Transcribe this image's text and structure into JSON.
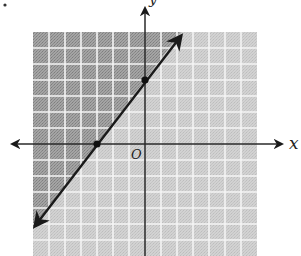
{
  "figure": {
    "type": "linear-inequality-graph",
    "axes": {
      "x_label": "x",
      "y_label": "y",
      "origin_label": "O"
    },
    "grid": {
      "x_min": -7,
      "x_max": 7,
      "y_min": -7,
      "y_max": 7,
      "unit_px": 16
    },
    "boundary_line": {
      "equation": "y = 4/3 x + 4",
      "style": "solid",
      "arrows": "both",
      "marked_points": [
        {
          "x": -3,
          "y": 0
        },
        {
          "x": 0,
          "y": 4
        }
      ]
    },
    "shading": {
      "region": "above-left of line",
      "shaded_color": "#9a9a9a",
      "unshaded_color": "#cfcfcf",
      "grid_line_color": "#f2f2f2"
    },
    "corner_mark": "•"
  }
}
